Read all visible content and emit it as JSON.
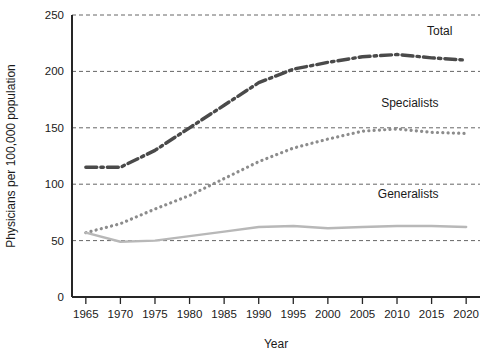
{
  "chart_data": {
    "type": "line",
    "title": "",
    "subtitle": "",
    "xlabel": "Year",
    "ylabel": "Physicians per 100,000 population",
    "xlim": [
      1963,
      2022
    ],
    "ylim": [
      0,
      250
    ],
    "grid": true,
    "grid_axis": "y",
    "legend_position": "inline-right",
    "x": [
      1965,
      1970,
      1975,
      1980,
      1985,
      1990,
      1995,
      2000,
      2005,
      2010,
      2015,
      2020
    ],
    "xticks": [
      "1965",
      "1970",
      "1975",
      "1980",
      "1985",
      "1990",
      "1995",
      "2000",
      "2005",
      "2010",
      "2015",
      "2020"
    ],
    "yticks": [
      "0",
      "50",
      "100",
      "150",
      "200",
      "250"
    ],
    "ytick_values": [
      0,
      50,
      100,
      150,
      200,
      250
    ],
    "series": [
      {
        "name": "Total",
        "label": "Total",
        "style": "dash-dot",
        "color": "#4a4a4a",
        "width": 3.4,
        "values": [
          115,
          115,
          130,
          150,
          170,
          190,
          202,
          208,
          213,
          215,
          212,
          210
        ]
      },
      {
        "name": "Specialists",
        "label": "Specialists",
        "style": "dotted",
        "color": "#8c8c8c",
        "width": 3.2,
        "values": [
          57,
          65,
          78,
          90,
          105,
          120,
          132,
          140,
          147,
          149,
          146,
          145
        ]
      },
      {
        "name": "Generalists",
        "label": "Generalists",
        "style": "solid",
        "color": "#b8b8b8",
        "width": 2.4,
        "values": [
          57,
          49,
          50,
          54,
          58,
          62,
          63,
          61,
          62,
          63,
          63,
          62
        ]
      }
    ],
    "annotations": [
      {
        "text": "Total",
        "x": 2018,
        "y": 232
      },
      {
        "text": "Specialists",
        "x": 2016,
        "y": 168
      },
      {
        "text": "Generalists",
        "x": 2016,
        "y": 88
      }
    ],
    "colors": {
      "axis": "#262626",
      "grid": "#555555",
      "background": "#ffffff",
      "text": "#1a1a1a"
    }
  }
}
